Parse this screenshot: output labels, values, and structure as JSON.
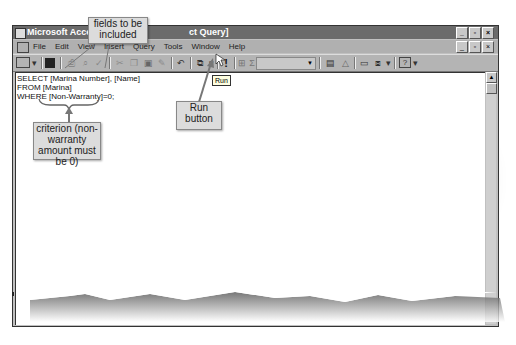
{
  "window": {
    "title": "Microsoft Access - [Query1 : Select Query]",
    "title_visible_left": "Microsoft Access",
    "title_visible_right": "ct Query]",
    "controls": [
      "minimize",
      "restore",
      "close"
    ]
  },
  "menubar": {
    "items": [
      {
        "label": "File",
        "icon": "mdi-document-icon"
      },
      {
        "label": "Edit"
      },
      {
        "label": "View"
      },
      {
        "label": "Insert"
      },
      {
        "label": "Query"
      },
      {
        "label": "Tools"
      },
      {
        "label": "Window"
      },
      {
        "label": "Help"
      }
    ]
  },
  "toolbar": {
    "buttons": [
      {
        "name": "view",
        "icon": "datasheet-view-icon"
      },
      {
        "name": "save",
        "icon": "save-icon"
      },
      {
        "name": "print",
        "icon": "print-icon"
      },
      {
        "name": "print-preview",
        "icon": "print-preview-icon"
      },
      {
        "name": "spelling",
        "icon": "spelling-icon"
      },
      {
        "name": "cut",
        "icon": "cut-icon"
      },
      {
        "name": "copy",
        "icon": "copy-icon"
      },
      {
        "name": "paste",
        "icon": "paste-icon"
      },
      {
        "name": "format-painter",
        "icon": "format-painter-icon"
      },
      {
        "name": "undo",
        "icon": "undo-icon"
      },
      {
        "name": "query-type",
        "icon": "query-type-icon"
      },
      {
        "name": "run",
        "icon": "run-icon",
        "glyph": "!"
      },
      {
        "name": "show-table",
        "icon": "show-table-icon"
      },
      {
        "name": "totals",
        "icon": "totals-icon",
        "glyph": "Σ"
      },
      {
        "name": "top-values",
        "icon": "top-values-combo",
        "value": ""
      },
      {
        "name": "properties",
        "icon": "properties-icon"
      },
      {
        "name": "build",
        "icon": "build-icon"
      },
      {
        "name": "database-window",
        "icon": "database-window-icon"
      },
      {
        "name": "new-object",
        "icon": "new-object-icon"
      },
      {
        "name": "help",
        "icon": "help-icon",
        "glyph": "?"
      }
    ],
    "tooltip": "Run"
  },
  "editor": {
    "sql_lines": [
      "SELECT [Marina Number], [Name]",
      "FROM [Marina]",
      "WHERE [Non-Warranty]=0;"
    ]
  },
  "callouts": {
    "fields": "fields to be included",
    "run_button": "Run button",
    "criterion": "criterion (non-warranty amount must be 0)"
  },
  "colors": {
    "titlebar": "#6b6b6b",
    "chrome": "#c0c0c0",
    "callout_bg": "#dcdcdc",
    "tooltip_bg": "#ffffe1"
  }
}
